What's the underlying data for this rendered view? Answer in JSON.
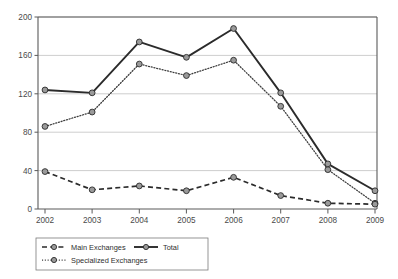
{
  "chart_data": {
    "type": "line",
    "title": "",
    "subtitle": "",
    "xlabel": "",
    "ylabel": "",
    "categories": [
      "2002",
      "2003",
      "2004",
      "2005",
      "2006",
      "2007",
      "2008",
      "2009"
    ],
    "x": [
      2002,
      2003,
      2004,
      2005,
      2006,
      2007,
      2008,
      2009
    ],
    "xlim": [
      2002,
      2009
    ],
    "ylim": [
      0,
      200
    ],
    "y_ticks": [
      0,
      40,
      80,
      120,
      160,
      200
    ],
    "y_tick_labels": [
      "0",
      "40",
      "80",
      "120",
      "160",
      "200"
    ],
    "grid": "horizontal",
    "legend_position": "bottom-left",
    "series": [
      {
        "name": "Main Exchanges",
        "style": "dashed",
        "marker": "circle",
        "color": "#2b2b2b",
        "values": [
          39,
          20,
          24,
          19,
          33,
          14,
          6,
          5
        ]
      },
      {
        "name": "Total",
        "style": "solid",
        "marker": "circle",
        "color": "#2b2b2b",
        "values": [
          124,
          121,
          174,
          158,
          188,
          121,
          47,
          19
        ]
      },
      {
        "name": "Specialized Exchanges",
        "style": "dotted",
        "marker": "circle",
        "color": "#3d3d3d",
        "values": [
          86,
          101,
          151,
          139,
          155,
          107,
          41,
          6
        ]
      }
    ]
  },
  "axes": {
    "y_labels": [
      "200",
      "160",
      "120",
      "80",
      "40",
      "0"
    ],
    "x_labels": [
      "2002",
      "2003",
      "2004",
      "2005",
      "2006",
      "2007",
      "2008",
      "2009"
    ]
  },
  "legend": {
    "entries": [
      {
        "label": "Main Exchanges",
        "style": "dashed"
      },
      {
        "label": "Total",
        "style": "solid"
      },
      {
        "label": "Specialized Exchanges",
        "style": "dotted"
      }
    ]
  },
  "colors": {
    "axis": "#5a5a5a",
    "grid": "#b9b9b9",
    "line_dark": "#2b2b2b",
    "line_mid": "#3d3d3d",
    "marker_fill": "#9a9a9a",
    "background": "#ffffff"
  }
}
